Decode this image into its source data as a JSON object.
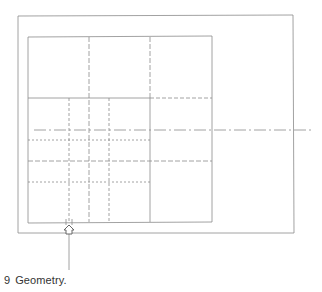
{
  "figure": {
    "number": "9",
    "caption": "Geometry."
  },
  "colors": {
    "line": "#8a8a8a",
    "text": "#333333",
    "background": "#ffffff"
  },
  "diagram": {
    "outer_frame": {
      "x1": 18,
      "y1": 16,
      "x2": 293,
      "y2": 233
    },
    "inner_square": {
      "x1": 28,
      "y1": 37,
      "x2": 212,
      "y2": 222
    },
    "horizontal_divider_y": 98,
    "vertical_lines": [
      {
        "x": 69,
        "style": "dashed",
        "from": 98,
        "to": 222
      },
      {
        "x": 89,
        "style": "dashed",
        "from": 37,
        "to": 222
      },
      {
        "x": 109,
        "style": "dashed",
        "from": 98,
        "to": 222
      },
      {
        "x": 150,
        "style": "dashed",
        "from": 37,
        "to": 98
      },
      {
        "x": 150,
        "style": "solid",
        "from": 98,
        "to": 222
      }
    ],
    "horizontal_lines": [
      {
        "y": 98,
        "style": "dashed",
        "from": 150,
        "to": 212
      },
      {
        "y": 130,
        "style": "dash-dot",
        "from": 34,
        "to": 312
      },
      {
        "y": 140,
        "style": "dotted",
        "from": 28,
        "to": 150
      },
      {
        "y": 161,
        "style": "dashed",
        "from": 28,
        "to": 212
      },
      {
        "y": 182,
        "style": "dotted",
        "from": 28,
        "to": 150
      }
    ],
    "marker": {
      "x": 69,
      "y": 230,
      "leader_to": 270
    }
  }
}
